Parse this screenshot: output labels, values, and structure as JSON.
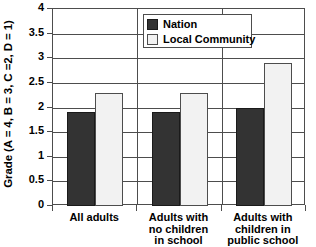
{
  "chart_data": {
    "type": "bar",
    "title": "",
    "subtitle": "",
    "xlabel": "",
    "ylabel": "Grade (A = 4, B = 3, C =2, D = 1)",
    "categories": [
      "All adults",
      "Adults with no children in school",
      "Adults with children in public school"
    ],
    "category_lines": [
      [
        "All adults"
      ],
      [
        "Adults with",
        "no children",
        "in school"
      ],
      [
        "Adults with",
        "children in",
        "public school"
      ]
    ],
    "series": [
      {
        "name": "Nation",
        "color": "#333333",
        "values": [
          1.9,
          1.9,
          2.0
        ]
      },
      {
        "name": "Local Community",
        "color": "#f2f2f2",
        "values": [
          2.3,
          2.3,
          2.9
        ]
      }
    ],
    "ylim": [
      0,
      4
    ],
    "ytick_values": [
      0,
      0.5,
      1,
      1.5,
      2,
      2.5,
      3,
      3.5,
      4
    ],
    "ytick_labels": [
      "0",
      "0.5",
      "1",
      "1.5",
      "2",
      "2.5",
      "3",
      "3.5",
      "4"
    ],
    "grid": "horizontal",
    "legend_position": "top-center",
    "legend_entries": [
      "Nation",
      "Local Community"
    ]
  },
  "axes": {
    "y_title": "Grade (A = 4, B = 3, C =2, D = 1)"
  },
  "legend": {
    "items": [
      {
        "label": "Nation"
      },
      {
        "label": "Local Community"
      }
    ]
  }
}
